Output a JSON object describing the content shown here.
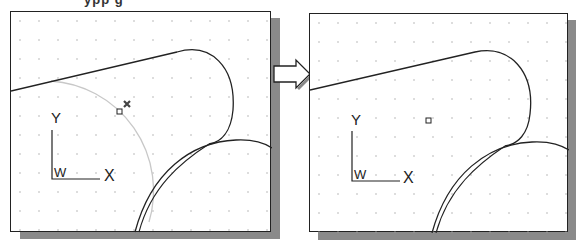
{
  "caption": {
    "cropped_text": "ypp g"
  },
  "panels": [
    {
      "name": "before",
      "axis_labels": {
        "x": "X",
        "y": "Y",
        "origin": "W"
      }
    },
    {
      "name": "after",
      "axis_labels": {
        "x": "X",
        "y": "Y",
        "origin": "W"
      }
    }
  ],
  "arrow": {
    "direction": "right"
  },
  "colors": {
    "line": "#222222",
    "guide_circle": "#c8c8c8",
    "grid_dot": "#a0a0a0",
    "shadow": "#8a8a8a"
  }
}
